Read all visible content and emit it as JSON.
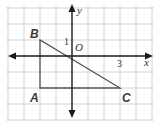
{
  "diagram": {
    "type": "coordinate-plane-triangle",
    "axes": {
      "x_label": "x",
      "y_label": "y",
      "origin_label": "O"
    },
    "tick_labels": {
      "x": "3",
      "y": "1"
    },
    "grid": {
      "x_min": -4,
      "x_max": 5,
      "y_min": -4,
      "y_max": 3
    },
    "points": [
      {
        "name": "A",
        "x": -2,
        "y": -2
      },
      {
        "name": "B",
        "x": -2,
        "y": 1
      },
      {
        "name": "C",
        "x": 3,
        "y": -2
      }
    ],
    "colors": {
      "grid": "#d4d4d4",
      "axis": "#1a1a1a",
      "triangle": "#555555"
    }
  }
}
